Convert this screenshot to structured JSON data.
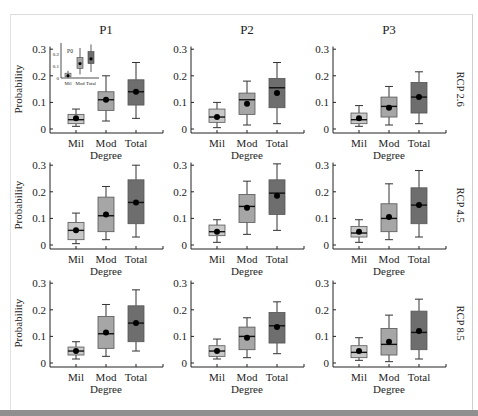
{
  "figure": {
    "column_titles": [
      "P1",
      "P2",
      "P3"
    ],
    "row_labels": [
      "RCP 2.6",
      "RCP 4.5",
      "RCP 8.5"
    ],
    "ylabel": "Probability",
    "xlabel": "Degree",
    "categories": [
      "Mil",
      "Mod",
      "Total"
    ],
    "yticks": [
      "0",
      "0.1",
      "0.2",
      "0.3"
    ],
    "colors": {
      "Mil": "#c8c8c8",
      "Mod": "#a6a6a6",
      "Total": "#6e6e6e",
      "line": "#222222"
    }
  },
  "chart_data": {
    "type": "box",
    "title": "",
    "xlabel": "Degree",
    "ylabel": "Probability",
    "ylim": [
      0,
      0.3
    ],
    "grid": false,
    "categories": [
      "Mil",
      "Mod",
      "Total"
    ],
    "panels": [
      {
        "row": "RCP 2.6",
        "col": "P1",
        "boxes": [
          {
            "cat": "Mil",
            "whislo": 0.01,
            "q1": 0.02,
            "med": 0.035,
            "q3": 0.055,
            "whishi": 0.075,
            "mean": 0.04
          },
          {
            "cat": "Mod",
            "whislo": 0.03,
            "q1": 0.07,
            "med": 0.11,
            "q3": 0.14,
            "whishi": 0.2,
            "mean": 0.11
          },
          {
            "cat": "Total",
            "whislo": 0.04,
            "q1": 0.09,
            "med": 0.14,
            "q3": 0.185,
            "whishi": 0.25,
            "mean": 0.14
          }
        ],
        "inset": {
          "title": "P0",
          "yticks": [
            "0",
            "0.1",
            "0.2"
          ],
          "boxes": [
            {
              "cat": "Mil",
              "whislo": 0.0,
              "q1": 0.01,
              "med": 0.02,
              "q3": 0.04,
              "whishi": 0.06,
              "mean": 0.02
            },
            {
              "cat": "Mod",
              "whislo": 0.03,
              "q1": 0.08,
              "med": 0.12,
              "q3": 0.17,
              "whishi": 0.25,
              "mean": 0.12
            },
            {
              "cat": "Total",
              "whislo": 0.05,
              "q1": 0.12,
              "med": 0.16,
              "q3": 0.22,
              "whishi": 0.28,
              "mean": 0.16
            }
          ]
        }
      },
      {
        "row": "RCP 2.6",
        "col": "P2",
        "boxes": [
          {
            "cat": "Mil",
            "whislo": 0.005,
            "q1": 0.025,
            "med": 0.045,
            "q3": 0.075,
            "whishi": 0.1,
            "mean": 0.045
          },
          {
            "cat": "Mod",
            "whislo": 0.015,
            "q1": 0.055,
            "med": 0.11,
            "q3": 0.135,
            "whishi": 0.18,
            "mean": 0.095
          },
          {
            "cat": "Total",
            "whislo": 0.02,
            "q1": 0.08,
            "med": 0.155,
            "q3": 0.19,
            "whishi": 0.25,
            "mean": 0.135
          }
        ]
      },
      {
        "row": "RCP 2.6",
        "col": "P3",
        "boxes": [
          {
            "cat": "Mil",
            "whislo": 0.01,
            "q1": 0.02,
            "med": 0.035,
            "q3": 0.06,
            "whishi": 0.088,
            "mean": 0.04
          },
          {
            "cat": "Mod",
            "whislo": 0.015,
            "q1": 0.045,
            "med": 0.085,
            "q3": 0.12,
            "whishi": 0.16,
            "mean": 0.08
          },
          {
            "cat": "Total",
            "whislo": 0.02,
            "q1": 0.06,
            "med": 0.12,
            "q3": 0.175,
            "whishi": 0.215,
            "mean": 0.12
          }
        ]
      },
      {
        "row": "RCP 4.5",
        "col": "P1",
        "boxes": [
          {
            "cat": "Mil",
            "whislo": 0.005,
            "q1": 0.02,
            "med": 0.055,
            "q3": 0.085,
            "whishi": 0.12,
            "mean": 0.055
          },
          {
            "cat": "Mod",
            "whislo": 0.02,
            "q1": 0.05,
            "med": 0.11,
            "q3": 0.18,
            "whishi": 0.22,
            "mean": 0.115
          },
          {
            "cat": "Total",
            "whislo": 0.03,
            "q1": 0.08,
            "med": 0.16,
            "q3": 0.245,
            "whishi": 0.3,
            "mean": 0.16
          }
        ]
      },
      {
        "row": "RCP 4.5",
        "col": "P2",
        "boxes": [
          {
            "cat": "Mil",
            "whislo": 0.01,
            "q1": 0.035,
            "med": 0.05,
            "q3": 0.075,
            "whishi": 0.095,
            "mean": 0.05
          },
          {
            "cat": "Mod",
            "whislo": 0.04,
            "q1": 0.085,
            "med": 0.145,
            "q3": 0.19,
            "whishi": 0.24,
            "mean": 0.14
          },
          {
            "cat": "Total",
            "whislo": 0.055,
            "q1": 0.115,
            "med": 0.195,
            "q3": 0.245,
            "whishi": 0.305,
            "mean": 0.185
          }
        ]
      },
      {
        "row": "RCP 4.5",
        "col": "P3",
        "boxes": [
          {
            "cat": "Mil",
            "whislo": 0.01,
            "q1": 0.03,
            "med": 0.045,
            "q3": 0.07,
            "whishi": 0.095,
            "mean": 0.05
          },
          {
            "cat": "Mod",
            "whislo": 0.02,
            "q1": 0.05,
            "med": 0.1,
            "q3": 0.155,
            "whishi": 0.23,
            "mean": 0.105
          },
          {
            "cat": "Total",
            "whislo": 0.03,
            "q1": 0.08,
            "med": 0.15,
            "q3": 0.215,
            "whishi": 0.28,
            "mean": 0.15
          }
        ]
      },
      {
        "row": "RCP 8.5",
        "col": "P1",
        "boxes": [
          {
            "cat": "Mil",
            "whislo": 0.015,
            "q1": 0.03,
            "med": 0.045,
            "q3": 0.06,
            "whishi": 0.08,
            "mean": 0.045
          },
          {
            "cat": "Mod",
            "whislo": 0.025,
            "q1": 0.055,
            "med": 0.11,
            "q3": 0.175,
            "whishi": 0.22,
            "mean": 0.115
          },
          {
            "cat": "Total",
            "whislo": 0.045,
            "q1": 0.08,
            "med": 0.15,
            "q3": 0.215,
            "whishi": 0.275,
            "mean": 0.15
          }
        ]
      },
      {
        "row": "RCP 8.5",
        "col": "P2",
        "boxes": [
          {
            "cat": "Mil",
            "whislo": 0.015,
            "q1": 0.025,
            "med": 0.045,
            "q3": 0.065,
            "whishi": 0.09,
            "mean": 0.045
          },
          {
            "cat": "Mod",
            "whislo": 0.02,
            "q1": 0.05,
            "med": 0.1,
            "q3": 0.135,
            "whishi": 0.17,
            "mean": 0.095
          },
          {
            "cat": "Total",
            "whislo": 0.035,
            "q1": 0.075,
            "med": 0.14,
            "q3": 0.19,
            "whishi": 0.23,
            "mean": 0.135
          }
        ]
      },
      {
        "row": "RCP 8.5",
        "col": "P3",
        "boxes": [
          {
            "cat": "Mil",
            "whislo": 0.01,
            "q1": 0.02,
            "med": 0.04,
            "q3": 0.065,
            "whishi": 0.095,
            "mean": 0.045
          },
          {
            "cat": "Mod",
            "whislo": 0.005,
            "q1": 0.03,
            "med": 0.07,
            "q3": 0.13,
            "whishi": 0.18,
            "mean": 0.08
          },
          {
            "cat": "Total",
            "whislo": 0.015,
            "q1": 0.05,
            "med": 0.115,
            "q3": 0.195,
            "whishi": 0.24,
            "mean": 0.12
          }
        ]
      }
    ]
  }
}
